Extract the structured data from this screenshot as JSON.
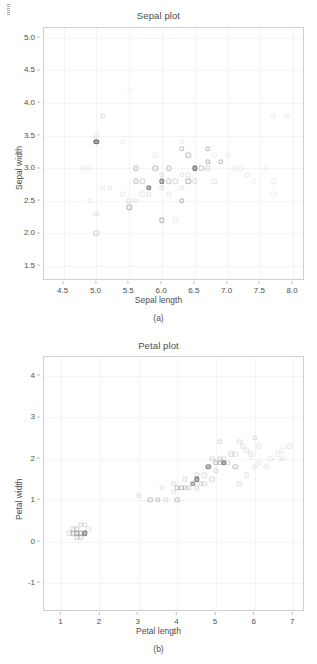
{
  "page": {
    "background": "#ffffff",
    "ink": "#4d4d4d",
    "marker_color": "#8c8c8c"
  },
  "figures": [
    {
      "id": "sepal",
      "title": "Sepal plot",
      "subcaption": "(a)",
      "xlabel": "Sepal length",
      "ylabel": "Sepal width",
      "xticks": [
        "4.5",
        "5.0",
        "5.5",
        "6.0",
        "6.5",
        "7.0",
        "7.5",
        "8.0"
      ],
      "xtick_values": [
        4.5,
        5.0,
        5.5,
        6.0,
        6.5,
        7.0,
        7.5,
        8.0
      ],
      "yticks": [
        "1.5",
        "2.0",
        "2.5",
        "3.0",
        "3.5",
        "4.0",
        "4.5",
        "5.0"
      ],
      "ytick_values": [
        1.5,
        2.0,
        2.5,
        3.0,
        3.5,
        4.0,
        4.5,
        5.0
      ],
      "xlim": [
        4.2,
        8.15
      ],
      "ylim": [
        1.3,
        5.15
      ]
    },
    {
      "id": "petal",
      "title": "Petal plot",
      "subcaption": "(b)",
      "xlabel": "Petal length",
      "ylabel": "Petal width",
      "xticks": [
        "1",
        "2",
        "3",
        "4",
        "5",
        "6",
        "7"
      ],
      "xtick_values": [
        1,
        2,
        3,
        4,
        5,
        6,
        7
      ],
      "yticks": [
        "-1",
        "0",
        "1",
        "2",
        "3",
        "4"
      ],
      "ytick_values": [
        -1,
        0,
        1,
        2,
        3,
        4
      ],
      "xlim": [
        0.55,
        7.25
      ],
      "ylim": [
        -1.65,
        4.45
      ]
    }
  ],
  "chart_data": [
    {
      "type": "scatter",
      "title": "Sepal plot",
      "xlabel": "Sepal length",
      "ylabel": "Sepal width",
      "xlim": [
        4.2,
        8.15
      ],
      "ylim": [
        1.3,
        5.15
      ],
      "xticks": [
        4.5,
        5.0,
        5.5,
        6.0,
        6.5,
        7.0,
        7.5,
        8.0
      ],
      "yticks": [
        1.5,
        2.0,
        2.5,
        3.0,
        3.5,
        4.0,
        4.5,
        5.0
      ],
      "grid": true,
      "legend": "none",
      "marker": "open-circle",
      "points": [
        {
          "x": 5.1,
          "y": 3.8,
          "o": 0.16
        },
        {
          "x": 5.0,
          "y": 3.4,
          "o": 0.78
        },
        {
          "x": 4.8,
          "y": 3.0,
          "o": 0.1
        },
        {
          "x": 4.9,
          "y": 3.0,
          "o": 0.08
        },
        {
          "x": 5.0,
          "y": 3.5,
          "o": 0.12
        },
        {
          "x": 5.0,
          "y": 2.0,
          "o": 0.22
        },
        {
          "x": 4.9,
          "y": 2.5,
          "o": 0.1
        },
        {
          "x": 5.0,
          "y": 2.3,
          "o": 0.14
        },
        {
          "x": 5.1,
          "y": 2.7,
          "o": 0.1
        },
        {
          "x": 5.2,
          "y": 2.7,
          "o": 0.12
        },
        {
          "x": 5.4,
          "y": 3.4,
          "o": 0.08
        },
        {
          "x": 5.4,
          "y": 2.6,
          "o": 0.1
        },
        {
          "x": 5.5,
          "y": 2.4,
          "o": 0.4
        },
        {
          "x": 5.5,
          "y": 2.5,
          "o": 0.14
        },
        {
          "x": 5.6,
          "y": 3.0,
          "o": 0.34
        },
        {
          "x": 5.6,
          "y": 2.8,
          "o": 0.3
        },
        {
          "x": 5.6,
          "y": 2.5,
          "o": 0.12
        },
        {
          "x": 5.7,
          "y": 2.8,
          "o": 0.22
        },
        {
          "x": 5.7,
          "y": 2.6,
          "o": 0.12
        },
        {
          "x": 5.8,
          "y": 2.7,
          "o": 0.62
        },
        {
          "x": 5.8,
          "y": 2.6,
          "o": 0.14
        },
        {
          "x": 5.9,
          "y": 3.0,
          "o": 0.34
        },
        {
          "x": 5.9,
          "y": 3.2,
          "o": 0.1
        },
        {
          "x": 6.0,
          "y": 2.9,
          "o": 0.16
        },
        {
          "x": 6.0,
          "y": 2.2,
          "o": 0.4
        },
        {
          "x": 6.0,
          "y": 2.7,
          "o": 0.16
        },
        {
          "x": 6.0,
          "y": 2.8,
          "o": 0.6
        },
        {
          "x": 6.1,
          "y": 3.0,
          "o": 0.32
        },
        {
          "x": 6.1,
          "y": 2.8,
          "o": 0.26
        },
        {
          "x": 6.1,
          "y": 2.6,
          "o": 0.12
        },
        {
          "x": 6.2,
          "y": 2.8,
          "o": 0.18
        },
        {
          "x": 6.2,
          "y": 2.2,
          "o": 0.1
        },
        {
          "x": 6.3,
          "y": 3.3,
          "o": 0.3
        },
        {
          "x": 6.3,
          "y": 2.5,
          "o": 0.38
        },
        {
          "x": 6.3,
          "y": 2.9,
          "o": 0.14
        },
        {
          "x": 6.3,
          "y": 2.7,
          "o": 0.12
        },
        {
          "x": 6.4,
          "y": 3.2,
          "o": 0.32
        },
        {
          "x": 6.4,
          "y": 2.8,
          "o": 0.38
        },
        {
          "x": 6.4,
          "y": 2.9,
          "o": 0.14
        },
        {
          "x": 6.5,
          "y": 3.0,
          "o": 0.7
        },
        {
          "x": 6.5,
          "y": 2.8,
          "o": 0.16
        },
        {
          "x": 6.6,
          "y": 3.0,
          "o": 0.26
        },
        {
          "x": 6.7,
          "y": 3.3,
          "o": 0.34
        },
        {
          "x": 6.7,
          "y": 3.1,
          "o": 0.38
        },
        {
          "x": 6.7,
          "y": 3.0,
          "o": 0.2
        },
        {
          "x": 6.8,
          "y": 2.8,
          "o": 0.12
        },
        {
          "x": 6.9,
          "y": 3.1,
          "o": 0.34
        },
        {
          "x": 7.0,
          "y": 3.2,
          "o": 0.1
        },
        {
          "x": 7.1,
          "y": 3.0,
          "o": 0.1
        },
        {
          "x": 7.2,
          "y": 3.0,
          "o": 0.09
        },
        {
          "x": 7.3,
          "y": 2.9,
          "o": 0.1
        },
        {
          "x": 7.4,
          "y": 2.8,
          "o": 0.08
        },
        {
          "x": 7.6,
          "y": 3.0,
          "o": 0.08
        },
        {
          "x": 7.7,
          "y": 3.8,
          "o": 0.09
        },
        {
          "x": 7.7,
          "y": 2.8,
          "o": 0.09
        },
        {
          "x": 7.7,
          "y": 2.6,
          "o": 0.1
        },
        {
          "x": 7.9,
          "y": 3.8,
          "o": 0.1
        },
        {
          "x": 6.3,
          "y": 3.4,
          "o": 0.09
        },
        {
          "x": 5.5,
          "y": 4.2,
          "o": 0.05
        },
        {
          "x": 6.8,
          "y": 3.2,
          "o": 0.07
        }
      ]
    },
    {
      "type": "scatter",
      "title": "Petal plot",
      "xlabel": "Petal length",
      "ylabel": "Petal width",
      "xlim": [
        0.55,
        7.25
      ],
      "ylim": [
        -1.65,
        4.45
      ],
      "xticks": [
        1,
        2,
        3,
        4,
        5,
        6,
        7
      ],
      "yticks": [
        -1,
        0,
        1,
        2,
        3,
        4
      ],
      "grid": true,
      "legend": "none",
      "marker": "open-circle",
      "points": [
        {
          "x": 1.3,
          "y": 0.2,
          "o": 0.3
        },
        {
          "x": 1.4,
          "y": 0.2,
          "o": 0.4
        },
        {
          "x": 1.4,
          "y": 0.1,
          "o": 0.26
        },
        {
          "x": 1.5,
          "y": 0.2,
          "o": 0.42
        },
        {
          "x": 1.5,
          "y": 0.1,
          "o": 0.24
        },
        {
          "x": 1.6,
          "y": 0.2,
          "o": 0.62
        },
        {
          "x": 1.3,
          "y": 0.3,
          "o": 0.2
        },
        {
          "x": 1.5,
          "y": 0.4,
          "o": 0.2
        },
        {
          "x": 1.2,
          "y": 0.2,
          "o": 0.18
        },
        {
          "x": 1.7,
          "y": 0.3,
          "o": 0.14
        },
        {
          "x": 1.4,
          "y": 0.3,
          "o": 0.26
        },
        {
          "x": 1.6,
          "y": 0.4,
          "o": 0.16
        },
        {
          "x": 3.0,
          "y": 1.1,
          "o": 0.16
        },
        {
          "x": 3.3,
          "y": 1.0,
          "o": 0.32
        },
        {
          "x": 3.5,
          "y": 1.0,
          "o": 0.3
        },
        {
          "x": 3.6,
          "y": 1.3,
          "o": 0.12
        },
        {
          "x": 3.7,
          "y": 1.0,
          "o": 0.16
        },
        {
          "x": 3.9,
          "y": 1.2,
          "o": 0.14
        },
        {
          "x": 3.9,
          "y": 1.4,
          "o": 0.16
        },
        {
          "x": 4.0,
          "y": 1.0,
          "o": 0.3
        },
        {
          "x": 4.0,
          "y": 1.3,
          "o": 0.3
        },
        {
          "x": 4.1,
          "y": 1.3,
          "o": 0.28
        },
        {
          "x": 4.2,
          "y": 1.3,
          "o": 0.26
        },
        {
          "x": 4.2,
          "y": 1.5,
          "o": 0.16
        },
        {
          "x": 4.3,
          "y": 1.3,
          "o": 0.24
        },
        {
          "x": 4.4,
          "y": 1.4,
          "o": 0.5
        },
        {
          "x": 4.5,
          "y": 1.5,
          "o": 0.68
        },
        {
          "x": 4.5,
          "y": 1.3,
          "o": 0.2
        },
        {
          "x": 4.5,
          "y": 1.6,
          "o": 0.18
        },
        {
          "x": 4.6,
          "y": 1.4,
          "o": 0.18
        },
        {
          "x": 4.7,
          "y": 1.4,
          "o": 0.18
        },
        {
          "x": 4.7,
          "y": 1.6,
          "o": 0.16
        },
        {
          "x": 4.8,
          "y": 1.8,
          "o": 0.58
        },
        {
          "x": 4.9,
          "y": 1.5,
          "o": 0.2
        },
        {
          "x": 4.9,
          "y": 2.0,
          "o": 0.2
        },
        {
          "x": 5.0,
          "y": 1.7,
          "o": 0.2
        },
        {
          "x": 5.0,
          "y": 1.9,
          "o": 0.34
        },
        {
          "x": 5.1,
          "y": 1.9,
          "o": 0.3
        },
        {
          "x": 5.1,
          "y": 2.4,
          "o": 0.2
        },
        {
          "x": 5.1,
          "y": 2.0,
          "o": 0.22
        },
        {
          "x": 5.2,
          "y": 2.0,
          "o": 0.16
        },
        {
          "x": 5.2,
          "y": 1.9,
          "o": 0.62
        },
        {
          "x": 5.3,
          "y": 1.9,
          "o": 0.2
        },
        {
          "x": 5.4,
          "y": 2.1,
          "o": 0.16
        },
        {
          "x": 5.5,
          "y": 1.8,
          "o": 0.32
        },
        {
          "x": 5.5,
          "y": 2.1,
          "o": 0.14
        },
        {
          "x": 5.6,
          "y": 2.4,
          "o": 0.16
        },
        {
          "x": 5.6,
          "y": 1.4,
          "o": 0.16
        },
        {
          "x": 5.7,
          "y": 2.3,
          "o": 0.14
        },
        {
          "x": 5.8,
          "y": 2.2,
          "o": 0.14
        },
        {
          "x": 5.8,
          "y": 1.6,
          "o": 0.12
        },
        {
          "x": 5.9,
          "y": 2.1,
          "o": 0.14
        },
        {
          "x": 6.0,
          "y": 2.5,
          "o": 0.16
        },
        {
          "x": 6.0,
          "y": 1.8,
          "o": 0.12
        },
        {
          "x": 6.1,
          "y": 2.3,
          "o": 0.12
        },
        {
          "x": 6.1,
          "y": 1.9,
          "o": 0.12
        },
        {
          "x": 6.3,
          "y": 1.8,
          "o": 0.1
        },
        {
          "x": 6.4,
          "y": 2.0,
          "o": 0.1
        },
        {
          "x": 6.6,
          "y": 2.1,
          "o": 0.1
        },
        {
          "x": 6.7,
          "y": 2.0,
          "o": 0.12
        },
        {
          "x": 6.9,
          "y": 2.3,
          "o": 0.12
        },
        {
          "x": 6.7,
          "y": 2.2,
          "o": 0.1
        }
      ]
    }
  ]
}
